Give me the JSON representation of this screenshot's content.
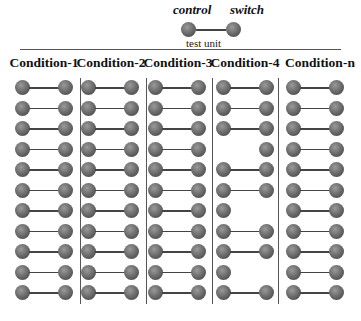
{
  "legend": {
    "control_label": "control",
    "switch_label": "switch",
    "unit_label": "test unit"
  },
  "conditions": [
    {
      "title": "Condition-1",
      "rows": [
        "both",
        "both",
        "both",
        "both",
        "both",
        "both",
        "both",
        "both",
        "both",
        "both",
        "both"
      ]
    },
    {
      "title": "Condition-2",
      "rows": [
        "both",
        "both",
        "both",
        "both",
        "both",
        "both",
        "both",
        "both",
        "both",
        "both",
        "both"
      ]
    },
    {
      "title": "Condition-3",
      "rows": [
        "both",
        "both",
        "both",
        "both",
        "both",
        "both",
        "both",
        "both",
        "both",
        "both",
        "both"
      ]
    },
    {
      "title": "Condition-4",
      "rows": [
        "both",
        "both",
        "both",
        "switch",
        "both",
        "both",
        "control",
        "both",
        "both",
        "control",
        "both"
      ]
    },
    {
      "title": "Condition-n",
      "rows": [
        "both",
        "both",
        "both",
        "both",
        "both",
        "both",
        "both",
        "both",
        "both",
        "both",
        "both"
      ]
    }
  ],
  "colors": {
    "bead": "#6e6e6e",
    "line": "#444444",
    "divider": "#555555"
  }
}
